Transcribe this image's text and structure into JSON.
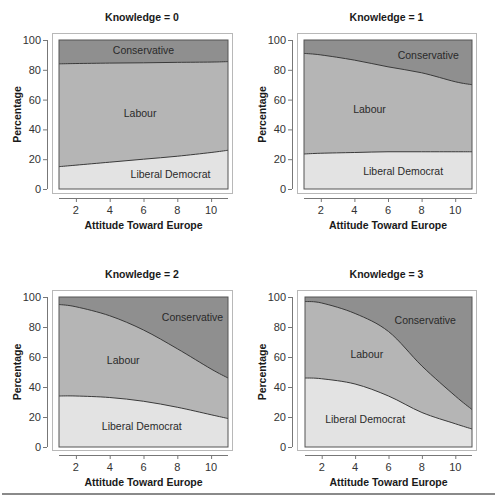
{
  "chart_data": [
    {
      "type": "area",
      "stacked": true,
      "title": "Knowledge = 0",
      "xlabel": "Attitude Toward Europe",
      "ylabel": "Percentage",
      "xlim": [
        1,
        11
      ],
      "ylim": [
        0,
        100
      ],
      "xticks": [
        2,
        4,
        6,
        8,
        10
      ],
      "yticks": [
        0,
        20,
        40,
        60,
        80,
        100
      ],
      "grid": false,
      "x": [
        1,
        2,
        4,
        6,
        8,
        10,
        11
      ],
      "series": [
        {
          "name": "Liberal Democrat",
          "values": [
            15,
            16,
            18,
            20,
            22,
            24.5,
            26
          ]
        },
        {
          "name": "Labour",
          "values": [
            69,
            68.2,
            66.5,
            64.7,
            63,
            60.7,
            59.5
          ]
        },
        {
          "name": "Conservative",
          "values": [
            16,
            15.8,
            15.5,
            15.3,
            15,
            14.8,
            14.5
          ]
        }
      ],
      "boundaries": {
        "libdem_upper": [
          15,
          16,
          18,
          20,
          22,
          24.5,
          26
        ],
        "labour_upper": [
          84,
          84.2,
          84.5,
          84.7,
          85,
          85.2,
          85.5
        ]
      },
      "labels": [
        {
          "text": "Conservative",
          "x": 6,
          "y": 93
        },
        {
          "text": "Labour",
          "x": 5.8,
          "y": 51
        },
        {
          "text": "Liberal Democrat",
          "x": 7.6,
          "y": 10
        }
      ]
    },
    {
      "type": "area",
      "stacked": true,
      "title": "Knowledge = 1",
      "xlabel": "Attitude Toward Europe",
      "ylabel": "Percentage",
      "xlim": [
        1,
        11
      ],
      "ylim": [
        0,
        100
      ],
      "xticks": [
        2,
        4,
        6,
        8,
        10
      ],
      "yticks": [
        0,
        20,
        40,
        60,
        80,
        100
      ],
      "grid": false,
      "x": [
        1,
        2,
        4,
        6,
        8,
        10,
        11
      ],
      "series": [
        {
          "name": "Liberal Democrat",
          "values": [
            23.5,
            24,
            24.5,
            25,
            25,
            25,
            25
          ]
        },
        {
          "name": "Labour",
          "values": [
            67.5,
            66,
            62,
            57,
            53,
            47,
            45
          ]
        },
        {
          "name": "Conservative",
          "values": [
            9,
            10,
            13.5,
            18,
            22,
            28,
            30
          ]
        }
      ],
      "boundaries": {
        "libdem_upper": [
          23.5,
          24,
          24.5,
          25,
          25,
          25,
          25
        ],
        "labour_upper": [
          91,
          90,
          86.5,
          82,
          78,
          72,
          70
        ]
      },
      "labels": [
        {
          "text": "Conservative",
          "x": 8.4,
          "y": 90
        },
        {
          "text": "Labour",
          "x": 4.9,
          "y": 54
        },
        {
          "text": "Liberal Democrat",
          "x": 6.9,
          "y": 12
        }
      ]
    },
    {
      "type": "area",
      "stacked": true,
      "title": "Knowledge = 2",
      "xlabel": "Attitude Toward Europe",
      "ylabel": "Percentage",
      "xlim": [
        1,
        11
      ],
      "ylim": [
        0,
        100
      ],
      "xticks": [
        2,
        4,
        6,
        8,
        10
      ],
      "yticks": [
        0,
        20,
        40,
        60,
        80,
        100
      ],
      "grid": false,
      "x": [
        1,
        2,
        4,
        6,
        8,
        10,
        11
      ],
      "series": [
        {
          "name": "Liberal Democrat",
          "values": [
            34,
            34,
            33,
            30.5,
            26.5,
            21.5,
            19
          ]
        },
        {
          "name": "Labour",
          "values": [
            61,
            59.5,
            54.5,
            47.5,
            39,
            30.5,
            27
          ]
        },
        {
          "name": "Conservative",
          "values": [
            5,
            6.5,
            12.5,
            22,
            34.5,
            48,
            54
          ]
        }
      ],
      "boundaries": {
        "libdem_upper": [
          34,
          34,
          33,
          30.5,
          26.5,
          21.5,
          19
        ],
        "labour_upper": [
          95,
          93.5,
          87.5,
          78,
          65.5,
          52,
          46
        ]
      },
      "labels": [
        {
          "text": "Conservative",
          "x": 8.9,
          "y": 87
        },
        {
          "text": "Labour",
          "x": 4.8,
          "y": 58
        },
        {
          "text": "Liberal Democrat",
          "x": 5.9,
          "y": 14
        }
      ]
    },
    {
      "type": "area",
      "stacked": true,
      "title": "Knowledge = 3",
      "xlabel": "Attitude Toward Europe",
      "ylabel": "Percentage",
      "xlim": [
        1,
        11
      ],
      "ylim": [
        0,
        100
      ],
      "xticks": [
        2,
        4,
        6,
        8,
        10
      ],
      "yticks": [
        0,
        20,
        40,
        60,
        80,
        100
      ],
      "grid": false,
      "x": [
        1,
        2,
        4,
        6,
        8,
        10,
        11
      ],
      "series": [
        {
          "name": "Liberal Democrat",
          "values": [
            46,
            45.5,
            42,
            34,
            23,
            15.5,
            12
          ]
        },
        {
          "name": "Labour",
          "values": [
            51,
            50.5,
            47,
            43,
            31,
            18.5,
            13
          ]
        },
        {
          "name": "Conservative",
          "values": [
            3,
            4,
            11,
            23,
            46,
            66,
            75
          ]
        }
      ],
      "boundaries": {
        "libdem_upper": [
          46,
          45.5,
          42,
          34,
          23,
          15.5,
          12
        ],
        "labour_upper": [
          97,
          96,
          89,
          77,
          54,
          34,
          25
        ]
      },
      "labels": [
        {
          "text": "Conservative",
          "x": 8.2,
          "y": 85
        },
        {
          "text": "Labour",
          "x": 4.7,
          "y": 62
        },
        {
          "text": "Liberal Democrat",
          "x": 4.6,
          "y": 19
        }
      ]
    }
  ],
  "colors": {
    "Conservative": "#8f8f8f",
    "Labour": "#b5b5b5",
    "Liberal Democrat": "#e3e3e3",
    "line": "#3a3a3a",
    "frame": "#b8b8b8",
    "plot_border": "#555555"
  },
  "layout": {
    "panels": [
      {
        "frame": [
          52,
          33,
          180,
          160
        ],
        "plot": [
          59,
          40,
          169,
          149
        ]
      },
      {
        "frame": [
          297,
          33,
          179,
          160
        ],
        "plot": [
          304,
          40,
          168,
          149
        ]
      },
      {
        "frame": [
          52,
          290,
          180,
          160
        ],
        "plot": [
          59,
          297,
          169,
          150
        ]
      },
      {
        "frame": [
          297,
          290,
          179,
          160
        ],
        "plot": [
          305,
          297,
          167,
          150
        ]
      }
    ]
  }
}
